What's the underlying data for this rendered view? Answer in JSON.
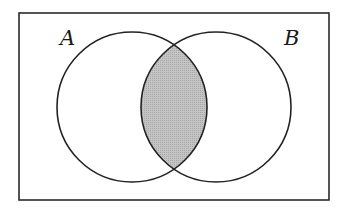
{
  "diagram": {
    "type": "venn",
    "universe": {
      "x": 19,
      "y": 13,
      "width": 310,
      "height": 187,
      "stroke": "#2a2a2a"
    },
    "sets": [
      {
        "id": "A",
        "label": "A",
        "cx": 132,
        "cy": 107,
        "r": 75,
        "label_x": 60,
        "label_y": 45
      },
      {
        "id": "B",
        "label": "B",
        "cx": 216,
        "cy": 107,
        "r": 75,
        "label_x": 284,
        "label_y": 45
      }
    ],
    "shaded_region": "A ∩ B",
    "colors": {
      "shade": "#bdbdbd",
      "stroke": "#222222",
      "background": "#ffffff"
    }
  }
}
